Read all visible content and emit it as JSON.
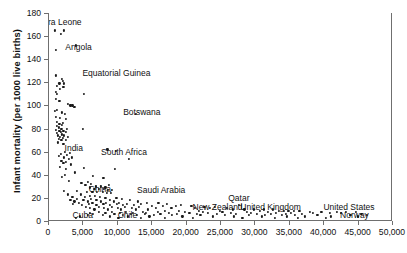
{
  "chart_data": {
    "type": "scatter",
    "title": "",
    "xlabel": "",
    "ylabel": "Infant mortality (per 1000 live births)",
    "xlim": [
      0,
      50000
    ],
    "ylim": [
      0,
      180
    ],
    "grid": false,
    "legend": "none",
    "xticks": [
      0,
      5000,
      10000,
      15000,
      20000,
      25000,
      30000,
      35000,
      40000,
      45000,
      50000
    ],
    "xticklabels": [
      "0",
      "5,000",
      "10,000",
      "15,000",
      "20,000",
      "25,000",
      "30,000",
      "35,000",
      "40,000",
      "45,000",
      "50,000"
    ],
    "yticks": [
      0,
      20,
      40,
      60,
      80,
      100,
      120,
      140,
      160,
      180
    ],
    "yticklabels": [
      "0",
      "20",
      "40",
      "60",
      "80",
      "100",
      "120",
      "140",
      "160",
      "180"
    ],
    "annotations": [
      {
        "label": "Sierra Leone",
        "x": 1200,
        "y": 172
      },
      {
        "label": "Angola",
        "x": 4300,
        "y": 151
      },
      {
        "label": "Equatorial Guinea",
        "x": 9800,
        "y": 128
      },
      {
        "label": "Botswana",
        "x": 13500,
        "y": 94
      },
      {
        "label": "India",
        "x": 3600,
        "y": 63
      },
      {
        "label": "South Africa",
        "x": 10900,
        "y": 60
      },
      {
        "label": "China",
        "x": 7400,
        "y": 28
      },
      {
        "label": "Saudi Arabia",
        "x": 16300,
        "y": 27
      },
      {
        "label": "Qatar",
        "x": 27600,
        "y": 20
      },
      {
        "label": "New Zealand",
        "x": 24500,
        "y": 12
      },
      {
        "label": "United Kingdom",
        "x": 32200,
        "y": 12
      },
      {
        "label": "United States",
        "x": 43600,
        "y": 12
      },
      {
        "label": "Cuba",
        "x": 4900,
        "y": 5
      },
      {
        "label": "Chile",
        "x": 11400,
        "y": 5
      },
      {
        "label": "Norway",
        "x": 44400,
        "y": 5
      }
    ],
    "points": [
      [
        900,
        165
      ],
      [
        2200,
        165
      ],
      [
        1700,
        162
      ],
      [
        3900,
        152
      ],
      [
        1000,
        148
      ],
      [
        1000,
        126
      ],
      [
        1900,
        123
      ],
      [
        2000,
        121
      ],
      [
        1500,
        119
      ],
      [
        2200,
        119
      ],
      [
        1100,
        117
      ],
      [
        2100,
        116
      ],
      [
        1600,
        114
      ],
      [
        1000,
        112
      ],
      [
        1200,
        110
      ],
      [
        5100,
        110
      ],
      [
        1000,
        106
      ],
      [
        1500,
        104
      ],
      [
        2700,
        101
      ],
      [
        3100,
        100
      ],
      [
        3400,
        100
      ],
      [
        3700,
        99
      ],
      [
        1200,
        96
      ],
      [
        900,
        95
      ],
      [
        1900,
        94
      ],
      [
        2300,
        93
      ],
      [
        12600,
        93
      ],
      [
        1000,
        90
      ],
      [
        1600,
        89
      ],
      [
        2500,
        88
      ],
      [
        1200,
        86
      ],
      [
        2000,
        85
      ],
      [
        1500,
        84
      ],
      [
        1900,
        83
      ],
      [
        1100,
        82
      ],
      [
        1400,
        81
      ],
      [
        1800,
        80
      ],
      [
        2600,
        80
      ],
      [
        4900,
        80
      ],
      [
        1000,
        79
      ],
      [
        1500,
        78
      ],
      [
        2100,
        78
      ],
      [
        1700,
        77
      ],
      [
        2400,
        77
      ],
      [
        1200,
        76
      ],
      [
        1900,
        75
      ],
      [
        1300,
        74
      ],
      [
        2200,
        74
      ],
      [
        1600,
        73
      ],
      [
        2800,
        73
      ],
      [
        2000,
        72
      ],
      [
        1400,
        71
      ],
      [
        1800,
        70
      ],
      [
        2400,
        70
      ],
      [
        1300,
        68
      ],
      [
        2100,
        67
      ],
      [
        8500,
        62
      ],
      [
        9700,
        61
      ],
      [
        2300,
        60
      ],
      [
        3000,
        59
      ],
      [
        1700,
        58
      ],
      [
        2600,
        57
      ],
      [
        1400,
        56
      ],
      [
        2200,
        55
      ],
      [
        3300,
        55
      ],
      [
        2900,
        54
      ],
      [
        11600,
        54
      ],
      [
        1800,
        52
      ],
      [
        2400,
        51
      ],
      [
        2100,
        50
      ],
      [
        3200,
        49
      ],
      [
        1600,
        47
      ],
      [
        5100,
        46
      ],
      [
        2500,
        45
      ],
      [
        9600,
        45
      ],
      [
        3800,
        42
      ],
      [
        2300,
        40
      ],
      [
        6400,
        39
      ],
      [
        1900,
        38
      ],
      [
        7900,
        37
      ],
      [
        2900,
        35
      ],
      [
        5700,
        34
      ],
      [
        4700,
        33
      ],
      [
        6100,
        32
      ],
      [
        5300,
        31
      ],
      [
        8700,
        31
      ],
      [
        6800,
        30
      ],
      [
        7600,
        30
      ],
      [
        8200,
        29
      ],
      [
        5900,
        29
      ],
      [
        6600,
        28
      ],
      [
        7200,
        28
      ],
      [
        8000,
        28
      ],
      [
        8600,
        27
      ],
      [
        9200,
        27
      ],
      [
        2200,
        26
      ],
      [
        4100,
        26
      ],
      [
        5500,
        25
      ],
      [
        6300,
        25
      ],
      [
        7000,
        25
      ],
      [
        7800,
        25
      ],
      [
        8400,
        24
      ],
      [
        9000,
        24
      ],
      [
        2800,
        23
      ],
      [
        4600,
        23
      ],
      [
        5900,
        22
      ],
      [
        6700,
        22
      ],
      [
        3400,
        21
      ],
      [
        5200,
        21
      ],
      [
        7400,
        21
      ],
      [
        8200,
        20
      ],
      [
        9800,
        20
      ],
      [
        4000,
        19
      ],
      [
        6100,
        19
      ],
      [
        10600,
        19
      ],
      [
        3100,
        18
      ],
      [
        5000,
        18
      ],
      [
        6900,
        18
      ],
      [
        8800,
        18
      ],
      [
        11800,
        18
      ],
      [
        3700,
        17
      ],
      [
        5600,
        17
      ],
      [
        7600,
        17
      ],
      [
        9400,
        17
      ],
      [
        12900,
        17
      ],
      [
        4300,
        16
      ],
      [
        6300,
        16
      ],
      [
        8300,
        16
      ],
      [
        10200,
        16
      ],
      [
        14200,
        16
      ],
      [
        15900,
        16
      ],
      [
        3500,
        15
      ],
      [
        5800,
        15
      ],
      [
        7900,
        15
      ],
      [
        9900,
        15
      ],
      [
        11300,
        15
      ],
      [
        13400,
        15
      ],
      [
        17100,
        15
      ],
      [
        19200,
        14
      ],
      [
        4800,
        14
      ],
      [
        6900,
        14
      ],
      [
        8900,
        14
      ],
      [
        10800,
        14
      ],
      [
        12400,
        14
      ],
      [
        14900,
        13
      ],
      [
        16500,
        13
      ],
      [
        18400,
        13
      ],
      [
        20700,
        13
      ],
      [
        22600,
        12
      ],
      [
        24100,
        12
      ],
      [
        5400,
        12
      ],
      [
        7300,
        12
      ],
      [
        9200,
        12
      ],
      [
        11000,
        12
      ],
      [
        13100,
        12
      ],
      [
        15500,
        11
      ],
      [
        17800,
        11
      ],
      [
        21200,
        11
      ],
      [
        23400,
        11
      ],
      [
        25800,
        11
      ],
      [
        27600,
        14
      ],
      [
        6000,
        11
      ],
      [
        8000,
        11
      ],
      [
        10000,
        11
      ],
      [
        12000,
        11
      ],
      [
        26700,
        10
      ],
      [
        28400,
        10
      ],
      [
        29800,
        10
      ],
      [
        31200,
        10
      ],
      [
        32600,
        10
      ],
      [
        6600,
        10
      ],
      [
        8600,
        10
      ],
      [
        10500,
        10
      ],
      [
        12600,
        10
      ],
      [
        14400,
        10
      ],
      [
        33400,
        9
      ],
      [
        34100,
        9
      ],
      [
        34800,
        9
      ],
      [
        35600,
        9
      ],
      [
        36400,
        9
      ],
      [
        16800,
        9
      ],
      [
        18900,
        9
      ],
      [
        21800,
        9
      ],
      [
        24800,
        9
      ],
      [
        30600,
        9
      ],
      [
        37900,
        8
      ],
      [
        39600,
        8
      ],
      [
        41900,
        8
      ],
      [
        43200,
        8
      ],
      [
        44600,
        8
      ],
      [
        7200,
        8
      ],
      [
        9100,
        8
      ],
      [
        11200,
        8
      ],
      [
        13700,
        8
      ],
      [
        15800,
        8
      ],
      [
        19800,
        8
      ],
      [
        22400,
        8
      ],
      [
        25200,
        8
      ],
      [
        28800,
        8
      ],
      [
        31800,
        8
      ],
      [
        5900,
        7
      ],
      [
        8200,
        7
      ],
      [
        10300,
        7
      ],
      [
        12200,
        7
      ],
      [
        14100,
        7
      ],
      [
        17400,
        7
      ],
      [
        20400,
        7
      ],
      [
        23100,
        7
      ],
      [
        26400,
        7
      ],
      [
        29400,
        7
      ],
      [
        33000,
        7
      ],
      [
        35200,
        7
      ],
      [
        38400,
        7
      ],
      [
        40800,
        7
      ],
      [
        42400,
        7
      ],
      [
        6400,
        6
      ],
      [
        9500,
        6
      ],
      [
        11900,
        6
      ],
      [
        13900,
        6
      ],
      [
        16200,
        6
      ],
      [
        18600,
        6
      ],
      [
        21500,
        6
      ],
      [
        24400,
        6
      ],
      [
        27200,
        6
      ],
      [
        30200,
        6
      ],
      [
        32200,
        6
      ],
      [
        34400,
        6
      ],
      [
        36800,
        6
      ],
      [
        45400,
        6
      ],
      [
        5600,
        5
      ],
      [
        7800,
        5
      ],
      [
        10700,
        5
      ],
      [
        12800,
        5
      ],
      [
        15200,
        5
      ],
      [
        17900,
        5
      ],
      [
        22000,
        5
      ],
      [
        25600,
        5
      ],
      [
        29000,
        5
      ],
      [
        31400,
        5
      ],
      [
        33800,
        5
      ],
      [
        35800,
        5
      ],
      [
        39000,
        5
      ],
      [
        43800,
        5
      ],
      [
        46200,
        5
      ],
      [
        4500,
        4
      ],
      [
        8800,
        4
      ],
      [
        11500,
        4
      ],
      [
        14600,
        4
      ],
      [
        19400,
        4
      ],
      [
        23800,
        4
      ],
      [
        26900,
        4
      ],
      [
        30900,
        4
      ],
      [
        34600,
        4
      ],
      [
        37200,
        4
      ],
      [
        41000,
        4
      ],
      [
        44900,
        4
      ],
      [
        3900,
        3
      ],
      [
        10100,
        3
      ],
      [
        13300,
        3
      ],
      [
        16900,
        3
      ],
      [
        20900,
        3
      ],
      [
        28100,
        3
      ],
      [
        32800,
        3
      ],
      [
        36200,
        3
      ],
      [
        40200,
        3
      ]
    ]
  }
}
